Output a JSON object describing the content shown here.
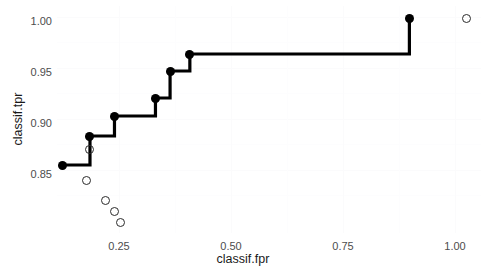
{
  "chart_data": {
    "type": "line",
    "title": "",
    "subtitle": "",
    "xlabel": "classif.fpr",
    "ylabel": "classif.tpr",
    "xlim": [
      0.13,
      1.03
    ],
    "ylim": [
      0.785,
      1.012
    ],
    "xticks": [
      0.25,
      0.5,
      0.75,
      1.0
    ],
    "xticklabels": [
      "0.25",
      "0.50",
      "0.75",
      "1.00"
    ],
    "yticks": [
      0.85,
      0.9,
      0.95,
      1.0
    ],
    "yticklabels": [
      "0.85",
      "0.90",
      "0.95",
      "1.00"
    ],
    "grid": true,
    "legend": "none",
    "series": [
      {
        "name": "step-curve",
        "style": "step-post",
        "marker": "filled-circle",
        "color": "#000000",
        "x": [
          0.142,
          0.2,
          0.252,
          0.339,
          0.37,
          0.412,
          0.878
        ],
        "y": [
          0.853,
          0.882,
          0.902,
          0.92,
          0.947,
          0.964,
          1.0
        ]
      },
      {
        "name": "scatter-open",
        "style": "points",
        "marker": "open-circle",
        "color": "#2b2b2b",
        "x": [
          0.2,
          0.192,
          0.232,
          0.252,
          0.265,
          1.0
        ],
        "y": [
          0.869,
          0.838,
          0.818,
          0.807,
          0.796,
          1.0
        ]
      }
    ]
  },
  "axes": {
    "x_title": "classif.fpr",
    "y_title": "classif.tpr",
    "x_tick_labels": [
      "0.25",
      "0.50",
      "0.75",
      "1.00"
    ],
    "y_tick_labels": [
      "1.00",
      "0.95",
      "0.90",
      "0.85"
    ]
  },
  "colors": {
    "foreground": "#000000",
    "tick_text": "#4d4d4d",
    "grid": "#fbfbfc",
    "panel_background": "#ffffff"
  }
}
